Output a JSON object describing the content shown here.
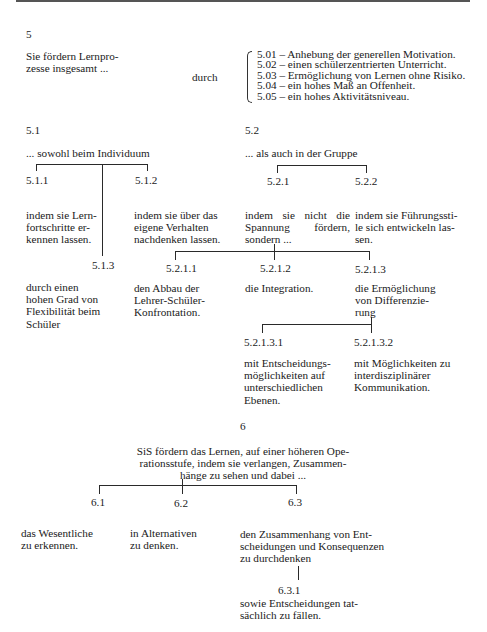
{
  "section5": {
    "number": "5",
    "intro": "Sie fördern Lernpro-\nzesse insgesamt ...",
    "connector": "durch",
    "items": [
      "5.01 – Anhebung der generellen Motivation.",
      "5.02 – einen schülerzentrierten Unterricht.",
      "5.03 – Ermöglichung von Lernen ohne Risiko.",
      "5.04 – ein hohes Maß an Offenheit.",
      "5.05 – ein hohes Aktivitätsniveau."
    ],
    "s51": {
      "number": "5.1",
      "heading": "... sowohl beim Individuum",
      "c511": {
        "number": "5.1.1",
        "text": "indem sie Lern-\nfortschritte er-\nkennen lassen."
      },
      "c512": {
        "number": "5.1.2",
        "text": "indem sie über das\neigene Verhalten\nnachdenken lassen."
      },
      "c513": {
        "number": "5.1.3",
        "text": "durch einen\nhohen Grad von\nFlexibilität beim\nSchüler"
      }
    },
    "s52": {
      "number": "5.2",
      "heading": "... als auch in der Gruppe",
      "c521": {
        "number": "5.2.1",
        "text_l1": "indem sie nicht die",
        "text_l2": "Spannung fördern,",
        "text_l3": "sondern ...",
        "c5211": {
          "number": "5.2.1.1",
          "text": "den Abbau der\nLehrer-Schüler-\nKonfrontation."
        },
        "c5212": {
          "number": "5.2.1.2",
          "text": "die Integration."
        },
        "c5213": {
          "number": "5.2.1.3",
          "text": "die Ermöglichung\nvon Differenzie-\nrung",
          "c52131": {
            "number": "5.2.1.3.1",
            "text": "mit Entscheidungs-\nmöglichkeiten auf\nunterschiedlichen\nEbenen."
          },
          "c52132": {
            "number": "5.2.1.3.2",
            "text": "mit Möglichkeiten zu\ninterdisziplinärer\nKommunikation."
          }
        }
      },
      "c522": {
        "number": "5.2.2",
        "text": "indem sie Führungssti-\nle sich entwickeln las-\nsen."
      }
    }
  },
  "section6": {
    "number": "6",
    "intro": "SiS fördern das Lernen, auf einer höheren Ope-\nrationsstufe, indem sie verlangen, Zusammen-\nhänge zu sehen und dabei ...",
    "c61": {
      "number": "6.1",
      "text": "das Wesentliche\nzu erkennen."
    },
    "c62": {
      "number": "6.2",
      "text": "in Alternativen\nzu denken."
    },
    "c63": {
      "number": "6.3",
      "text": "den Zusammenhang von Ent-\nscheidungen und Konsequenzen\nzu durchdenken",
      "c631": {
        "number": "6.3.1",
        "text": "sowie Entscheidungen tat-\nsächlich zu fällen."
      }
    }
  }
}
